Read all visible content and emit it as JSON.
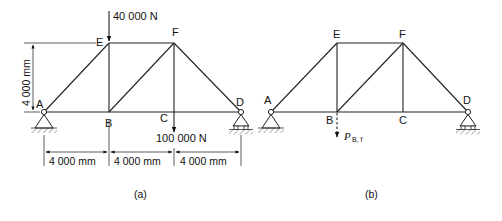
{
  "figure": {
    "panels": [
      {
        "id": "a",
        "caption": "(a)",
        "nodes": {
          "A": {
            "label": "A",
            "x": 44,
            "y": 112
          },
          "B": {
            "label": "B",
            "x": 109,
            "y": 112
          },
          "C": {
            "label": "C",
            "x": 174,
            "y": 112
          },
          "D": {
            "label": "D",
            "x": 241,
            "y": 112
          },
          "E": {
            "label": "E",
            "x": 109,
            "y": 43
          },
          "F": {
            "label": "F",
            "x": 174,
            "y": 43
          }
        },
        "members": [
          "A-B",
          "B-C",
          "C-D",
          "A-E",
          "E-F",
          "F-D",
          "E-B",
          "B-F",
          "F-C"
        ],
        "loads": [
          {
            "node": "E",
            "label": "40 000 N",
            "direction": "down"
          },
          {
            "node": "C",
            "label": "100 000 N",
            "direction": "down"
          }
        ],
        "dimensions": {
          "height_label": "4 000 mm",
          "spans": [
            "4 000 mm",
            "4 000 mm",
            "4 000 mm"
          ]
        },
        "supports": {
          "A": "pin",
          "D": "roller"
        }
      },
      {
        "id": "b",
        "caption": "(b)",
        "nodes": {
          "A": {
            "label": "A",
            "x": 271,
            "y": 112
          },
          "B": {
            "label": "B",
            "x": 337,
            "y": 112
          },
          "C": {
            "label": "C",
            "x": 403,
            "y": 112
          },
          "D": {
            "label": "D",
            "x": 468,
            "y": 112
          },
          "E": {
            "label": "E",
            "x": 337,
            "y": 43
          },
          "F": {
            "label": "F",
            "x": 403,
            "y": 43
          }
        },
        "members": [
          "A-B",
          "B-C",
          "C-D",
          "A-E",
          "E-F",
          "F-D",
          "E-B",
          "B-F",
          "F-C"
        ],
        "loads": [
          {
            "node": "B",
            "label_main": "P",
            "label_sub": "B, f",
            "direction": "down",
            "style": "dashed"
          }
        ],
        "supports": {
          "A": "pin",
          "D": "roller"
        }
      }
    ]
  }
}
